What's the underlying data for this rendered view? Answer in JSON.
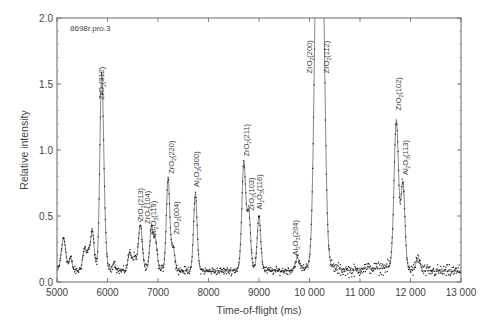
{
  "chart_data": {
    "type": "scatter",
    "title": "",
    "sample_label": "8698r.pro.3",
    "xlabel": "Time-of-flight (ms)",
    "ylabel": "Relative intensity",
    "xlim": [
      5000,
      13000
    ],
    "ylim": [
      0.0,
      2.0
    ],
    "x_ticks": [
      5000,
      6000,
      7000,
      8000,
      9000,
      10000,
      11000,
      12000,
      13000
    ],
    "x_tick_labels": [
      "5000",
      "6000",
      "7000",
      "8000",
      "9000",
      "10 000",
      "11 000",
      "12 000",
      "13 000"
    ],
    "y_ticks": [
      0.0,
      0.5,
      1.0,
      1.5,
      2.0
    ],
    "y_tick_labels": [
      "0.0",
      "0.5",
      "1.0",
      "1.5",
      "2.0"
    ],
    "grid": false,
    "legend": null,
    "baseline": 0.08,
    "series": [
      {
        "name": "Observed (points) and fitted profile (line)",
        "peaks": [
          {
            "x": 5130,
            "y": 0.33,
            "width": 45,
            "label": ""
          },
          {
            "x": 5270,
            "y": 0.18,
            "width": 30,
            "label": ""
          },
          {
            "x": 5550,
            "y": 0.25,
            "width": 40,
            "label": ""
          },
          {
            "x": 5630,
            "y": 0.18,
            "width": 30,
            "label": ""
          },
          {
            "x": 5700,
            "y": 0.37,
            "width": 35,
            "label": ""
          },
          {
            "x": 5880,
            "y": 1.32,
            "width": 35,
            "label": "ZrO2(312)"
          },
          {
            "x": 5920,
            "y": 0.5,
            "width": 40,
            "label": ""
          },
          {
            "x": 6130,
            "y": 0.14,
            "width": 30,
            "label": ""
          },
          {
            "x": 6440,
            "y": 0.22,
            "width": 35,
            "label": ""
          },
          {
            "x": 6530,
            "y": 0.18,
            "width": 35,
            "label": ""
          },
          {
            "x": 6650,
            "y": 0.43,
            "width": 40,
            "label": "ZrO2(213)"
          },
          {
            "x": 6870,
            "y": 0.4,
            "width": 35,
            "label": "ZrO2(104)"
          },
          {
            "x": 6950,
            "y": 0.3,
            "width": 35,
            "label": "Al2O3(119)"
          },
          {
            "x": 7200,
            "y": 0.78,
            "width": 35,
            "label": "ZrO2(220)"
          },
          {
            "x": 7300,
            "y": 0.25,
            "width": 35,
            "label": "ZrO2(004)"
          },
          {
            "x": 7740,
            "y": 0.67,
            "width": 35,
            "label": "Al2O3(300)"
          },
          {
            "x": 8700,
            "y": 0.9,
            "width": 40,
            "label": "ZrO2(211)"
          },
          {
            "x": 8800,
            "y": 0.5,
            "width": 35,
            "label": "ZrO2(103)"
          },
          {
            "x": 9000,
            "y": 0.5,
            "width": 35,
            "label": "Al2O3(116)"
          },
          {
            "x": 9760,
            "y": 0.17,
            "width": 40,
            "label": "Al2O3(204)"
          },
          {
            "x": 10150,
            "y": 2.6,
            "width": 55,
            "label": "ZrO2(200)"
          },
          {
            "x": 10250,
            "y": 2.4,
            "width": 55,
            "label": "ZrO2(112)"
          },
          {
            "x": 11720,
            "y": 1.22,
            "width": 45,
            "label": "ZrO2(102)"
          },
          {
            "x": 11850,
            "y": 0.73,
            "width": 40,
            "label": "Al2O3(113)"
          },
          {
            "x": 12150,
            "y": 0.18,
            "width": 40,
            "label": ""
          }
        ]
      }
    ],
    "annotations": [
      {
        "text_main": "ZrO",
        "sub": "2",
        "hkl": "(312)",
        "x": 5880,
        "y_top": 1.72,
        "y_bottom": 1.38
      },
      {
        "text_main": "ZrO",
        "sub": "2",
        "hkl": "(213)",
        "x": 6650,
        "y_top": 0.72,
        "y_bottom": 0.46
      },
      {
        "text_main": "ZrO",
        "sub": "2",
        "hkl": "(104)",
        "x": 6790,
        "y_top": 0.69,
        "y_bottom": 0.44
      },
      {
        "text_main": "Al",
        "sub": "2",
        "text_mid": "O",
        "sub2": "3",
        "hkl": "(119)",
        "x": 6910,
        "y_top": 0.61,
        "y_bottom": 0.35
      },
      {
        "text_main": "ZrO",
        "sub": "2",
        "hkl": "(220)",
        "x": 7260,
        "y_top": 1.05,
        "y_bottom": 0.82
      },
      {
        "text_main": "ZrO",
        "sub": "2",
        "hkl": "(004)",
        "x": 7370,
        "y_top": 0.62,
        "y_bottom": 0.36
      },
      {
        "text_main": "Al",
        "sub": "2",
        "text_mid": "O",
        "sub2": "3",
        "hkl": "(300)",
        "x": 7760,
        "y_top": 1.03,
        "y_bottom": 0.72
      },
      {
        "text_main": "ZrO",
        "sub": "2",
        "hkl": "(211)",
        "x": 8750,
        "y_top": 1.22,
        "y_bottom": 0.95
      },
      {
        "text_main": "ZrO",
        "sub": "2",
        "hkl": "(103)",
        "x": 8850,
        "y_top": 0.82,
        "y_bottom": 0.54
      },
      {
        "text_main": "Al",
        "sub": "2",
        "text_mid": "O",
        "sub2": "3",
        "hkl": "(116)",
        "x": 9010,
        "y_top": 0.82,
        "y_bottom": 0.55
      },
      {
        "text_main": "Al",
        "sub": "2",
        "text_mid": "O",
        "sub2": "3",
        "hkl": "(204)",
        "x": 9720,
        "y_top": 0.49,
        "y_bottom": 0.2
      },
      {
        "text_main": "ZrO",
        "sub": "2",
        "hkl": "(200)",
        "x": 10000,
        "y_top": 1.83,
        "y_bottom": 1.58
      },
      {
        "text_main": "ZrO",
        "sub": "2",
        "hkl": "(112)",
        "x": 10330,
        "y_top": 1.83,
        "y_bottom": 1.58
      },
      {
        "text_main": "ZrO",
        "sub": "2",
        "hkl": "(102)",
        "x": 11760,
        "y_top": 1.65,
        "y_bottom": 1.3
      },
      {
        "text_main": "Al",
        "sub": "2",
        "text_mid": "O",
        "sub2": "3",
        "hkl": "(113)",
        "x": 11900,
        "y_top": 1.13,
        "y_bottom": 0.81
      }
    ]
  },
  "colors": {
    "axis": "#555555",
    "line": "#444444",
    "points": "#222222",
    "text": "#444444"
  }
}
